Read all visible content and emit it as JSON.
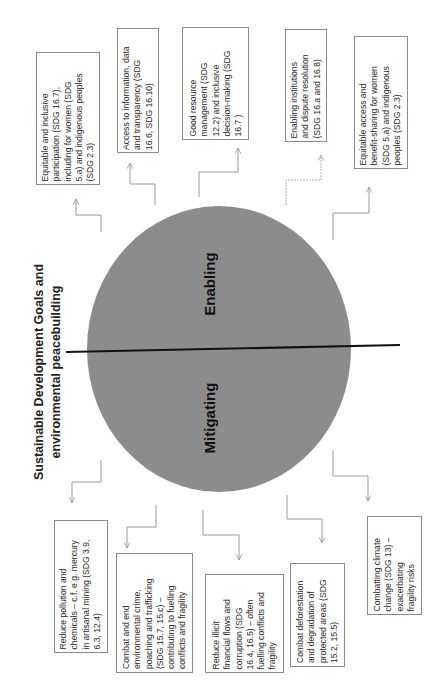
{
  "title": {
    "line1": "Sustainable Development Goals and",
    "line2": "environmental peacebuilding"
  },
  "circle": {
    "fill": "#8c8c8c",
    "upper_label": "Enabling",
    "lower_label": "Mitigating"
  },
  "enabling_items": [
    {
      "text": "Equitable and inclusive\nparticipation (SDG 16.7),\nincluding for women (SDG\n5.a) and indigenous peoples\n(SDG 2.3)"
    },
    {
      "text": "Access to information, data\nand transparency (SDG\n16.6, SDG 16.10)"
    },
    {
      "text": "Good resource\nmanagement (SDG\n12.2) and inclusive\ndecision-making (SDG\n16.7 )"
    },
    {
      "text": "Enabling institutions\nand dispute resolution\n(SDG 16.a and 16.8)"
    },
    {
      "text": "Equitable access and\nbenefit-sharing for women\n(SDG 5.a) and indigenous\npeoples (SDG 2.3)"
    }
  ],
  "mitigating_items": [
    {
      "text": "Reduce pollution and\nchemicals – c.f. e.g. mercury\nin artisanal mining (SDG 3.9,\n6.3, 12.4)"
    },
    {
      "text": "Combat and end\nenvironmental crime,\npoaching and trafficking\n(SDG 15.7, 15.c) –\ncontributing to fuelling\nconflicts and fragility"
    },
    {
      "text": "Reduce illicit\nfinancial flows and\ncorruption  (SDG\n16.4, 16.5) – often\nfuelling conflicts and\nfragility"
    },
    {
      "text": "Combat deforestation\nand degradation of\nprotected areas (SDG\n15.2, 15.5)"
    },
    {
      "text": "Combatting climate\nchange (SDG 13) –\nexacerbating\nfragility risks"
    }
  ]
}
